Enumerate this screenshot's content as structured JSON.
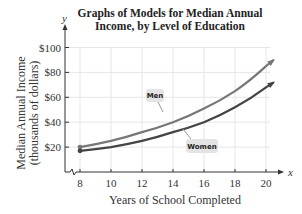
{
  "chart_data": {
    "type": "line",
    "title": "Graphs of Models for Median Annual Income, by Level of Education",
    "title_lines": [
      "Graphs of Models for Median Annual",
      "Income, by Level of Education"
    ],
    "xlabel": "Years of School Completed",
    "ylabel": "Median Annual Income (thousands of dollars)",
    "ylabel_lines": [
      "Median Annual Income",
      "(thousands of dollars)"
    ],
    "x_axis_var": "x",
    "y_axis_var": "y",
    "x": [
      8,
      10,
      12,
      14,
      16,
      18,
      20
    ],
    "xticks": [
      "8",
      "10",
      "12",
      "14",
      "16",
      "18",
      "20"
    ],
    "yticks": [
      "$20",
      "$40",
      "$60",
      "$80",
      "$100"
    ],
    "xlim": [
      6.5,
      21
    ],
    "ylim": [
      0,
      100
    ],
    "grid": true,
    "legend_position": "inline labels",
    "series": [
      {
        "name": "Men",
        "color": "#777777",
        "values": [
          20,
          25,
          32,
          40,
          51,
          65,
          85
        ]
      },
      {
        "name": "Women",
        "color": "#444444",
        "values": [
          17,
          20,
          25,
          32,
          40,
          52,
          68
        ]
      }
    ],
    "annotations": [
      "Men",
      "Women"
    ]
  }
}
